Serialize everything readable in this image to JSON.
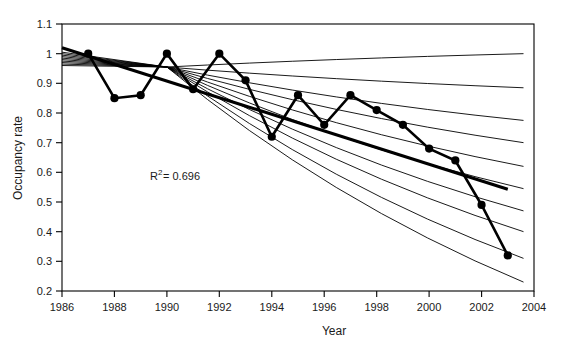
{
  "chart_data": {
    "type": "line",
    "title": "",
    "xlabel": "Year",
    "ylabel": "Occupancy rate",
    "xlim": [
      1986,
      2004
    ],
    "ylim": [
      0.2,
      1.1
    ],
    "grid": false,
    "legend": "none",
    "x_ticks": [
      "1986",
      "1988",
      "1990",
      "1992",
      "1994",
      "1996",
      "1998",
      "2000",
      "2002",
      "2004"
    ],
    "x_tick_values": [
      1986,
      1988,
      1990,
      1992,
      1994,
      1996,
      1998,
      2000,
      2002,
      2004
    ],
    "y_ticks": [
      "0.2",
      "0.3",
      "0.4",
      "0.5",
      "0.6",
      "0.7",
      "0.8",
      "0.9",
      "1",
      "1.1"
    ],
    "y_tick_values": [
      0.2,
      0.3,
      0.4,
      0.5,
      0.6,
      0.7,
      0.8,
      0.9,
      1.0,
      1.1
    ],
    "annotations": [
      {
        "name": "r-squared",
        "base": "R",
        "sup": "2",
        "rest": " = 0.696",
        "value": 0.696,
        "x": 1991.0,
        "y": 0.598
      }
    ],
    "series": [
      {
        "name": "Observed occupancy rate",
        "style": "line-markers",
        "x": [
          1987,
          1988,
          1989,
          1990,
          1991,
          1992,
          1993,
          1994,
          1995,
          1996,
          1997,
          1998,
          1999,
          2000,
          2001,
          2002,
          2003
        ],
        "values": [
          1.0,
          0.85,
          0.86,
          1.0,
          0.88,
          1.0,
          0.91,
          0.72,
          0.86,
          0.76,
          0.86,
          0.81,
          0.76,
          0.68,
          0.64,
          0.49,
          0.32
        ]
      },
      {
        "name": "Linear trend",
        "style": "thick-line",
        "x": [
          1986,
          2003
        ],
        "values": [
          1.02,
          0.543
        ]
      }
    ],
    "fan_curves": {
      "name": "Projection family",
      "style": "thin-curves",
      "origin_x": 1990,
      "origin_y": 0.955,
      "start_x": 1986,
      "count": 10,
      "start_values": [
        1.005,
        1.0,
        0.995,
        0.99,
        0.985,
        0.98,
        0.975,
        0.97,
        0.965,
        0.96
      ],
      "end_x": 2003.6,
      "end_values": [
        1.0,
        0.885,
        0.775,
        0.7,
        0.62,
        0.545,
        0.47,
        0.4,
        0.31,
        0.23
      ]
    }
  }
}
